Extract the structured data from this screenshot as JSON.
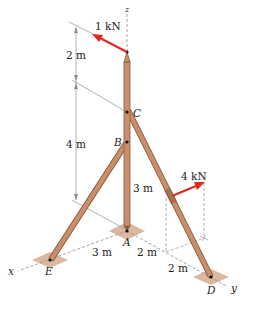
{
  "diagram": {
    "colors": {
      "member": "#c98f6a",
      "member_edge": "#8a5a3c",
      "force_arrow": "#e02a1c",
      "pad": "#d9b9a0",
      "dim_line": "#8c8c8c"
    },
    "axes": {
      "x": "x",
      "y": "y",
      "z": "z"
    },
    "points": {
      "A": "A",
      "B": "B",
      "C": "C",
      "D": "D",
      "E": "E"
    },
    "forces": [
      {
        "id": "top",
        "label": "1 kN"
      },
      {
        "id": "strut",
        "label": "4 kN"
      }
    ],
    "dimensions": {
      "top_segment": "2 m",
      "mid_segment": "4 m",
      "AB": "3 m",
      "AE": "3 m",
      "A_to_foot": "2 m",
      "foot_to_D": "2 m"
    }
  }
}
